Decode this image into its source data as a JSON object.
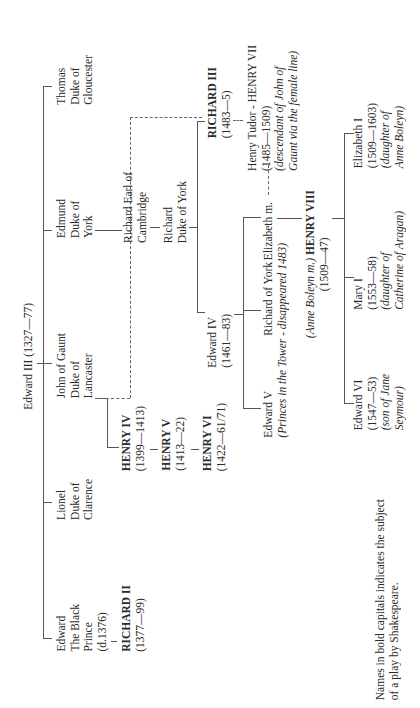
{
  "root": {
    "name": "Edward III",
    "dates": "(1327—77)"
  },
  "children": {
    "black_prince": {
      "lines": [
        "Edward",
        "The Black",
        "Prince",
        "(d.1376)"
      ]
    },
    "lionel": {
      "lines": [
        "Lionel",
        "Duke of",
        "Clarence"
      ]
    },
    "john": {
      "lines": [
        "John of Gaunt",
        "Duke of",
        "Lancaster"
      ]
    },
    "edmund": {
      "lines": [
        "Edmund",
        "Duke of",
        "York"
      ]
    },
    "thomas": {
      "lines": [
        "Thomas",
        "Duke of",
        "Gloucester"
      ]
    }
  },
  "richard2": {
    "name": "RICHARD II",
    "dates": "(1377—99)"
  },
  "henry4": {
    "name": "HENRY IV",
    "dates": "(1399—1413)"
  },
  "henry5": {
    "name": "HENRY V",
    "dates": "(1413—22)"
  },
  "henry6": {
    "name": "HENRY VI",
    "dates": "(1422—61/71)"
  },
  "cambridge": {
    "lines": [
      "Richard Earl of",
      "Cambridge"
    ]
  },
  "duke_york": {
    "lines": [
      "Richard",
      "Duke of York"
    ]
  },
  "richard3": {
    "name": "RICHARD III",
    "dates": "(1483—5)"
  },
  "henry7": {
    "name": "Henry Tudor - HENRY VII",
    "dates": "(1485—1509)",
    "note1": "(descendant of John of",
    "note2": "Gaunt via the female line)"
  },
  "edward4": {
    "name": "Edward IV",
    "dates": "(1461—83)"
  },
  "edward5": {
    "name": "Edward V",
    "note": "(Princes in the Tower - disappeared 1483)"
  },
  "richard_york": {
    "name": "Richard of York"
  },
  "elizabeth_m": {
    "name": "Elizabeth m."
  },
  "henry8": {
    "prefix": "(Anne Boleyn m.)",
    "name": "HENRY VIII",
    "dates": "(1509—47)"
  },
  "edward6": {
    "lines": [
      "Edward VI",
      "(1547—53)",
      "(son of Jane",
      "Seymour)"
    ]
  },
  "mary1": {
    "lines": [
      "Mary I",
      "(1553—58)",
      "(daughter of",
      "Catherine of Aragan)"
    ]
  },
  "elizabeth1": {
    "lines": [
      "Elizabeth I",
      "(1509—1603)",
      "(daughter of",
      "Anne Boleyn)"
    ]
  },
  "footnote": {
    "line1": "Names in bold capitals indicates the subject",
    "line2": "of a play by Shakespeare."
  }
}
